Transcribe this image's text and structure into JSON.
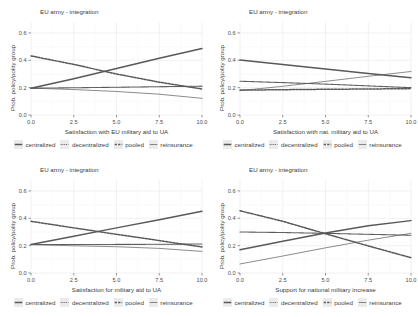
{
  "figure": {
    "facet_title": "EU army - integration",
    "ylabel": "Prob. policy/polity group",
    "panel_bg": "#ffffff",
    "grid_color": "#ebebeb",
    "line_color": "#595959",
    "text_color": "#3d3d3d"
  },
  "legend": {
    "items": [
      {
        "label": "centralized",
        "style": "solid-thick"
      },
      {
        "label": "decentralized",
        "style": "dotted-thin"
      },
      {
        "label": "pooled",
        "style": "dashed-thick"
      },
      {
        "label": "reinsurance",
        "style": "solid-thin"
      }
    ]
  },
  "chart_data": [
    {
      "type": "line",
      "title": "EU army - integration",
      "xlabel": "Satisfaction with EU military aid to UA",
      "ylabel": "Prob. policy/polity group",
      "xlim": [
        0,
        10
      ],
      "ylim": [
        0,
        0.68
      ],
      "xticks": [
        "0.0",
        "2.5",
        "5.0",
        "7.5",
        "10.0"
      ],
      "xtickvals": [
        0,
        2.5,
        5,
        7.5,
        10
      ],
      "yticks": [
        "0.0",
        "0.2",
        "0.4",
        "0.6"
      ],
      "ytickvals": [
        0,
        0.2,
        0.4,
        0.6
      ],
      "grid": true,
      "legend_position": "bottom",
      "x": [
        0,
        2.5,
        5,
        7.5,
        10
      ],
      "series": [
        {
          "name": "centralized",
          "style": "solid-thick",
          "values": [
            0.195,
            0.265,
            0.34,
            0.415,
            0.487
          ]
        },
        {
          "name": "decentralized",
          "style": "dotted-thin",
          "values": [
            0.196,
            0.199,
            0.203,
            0.207,
            0.211
          ]
        },
        {
          "name": "pooled",
          "style": "dashed-thick",
          "values": [
            0.432,
            0.37,
            0.3,
            0.24,
            0.19
          ]
        },
        {
          "name": "reinsurance",
          "style": "solid-thin",
          "values": [
            0.197,
            0.186,
            0.172,
            0.152,
            0.122
          ]
        }
      ]
    },
    {
      "type": "line",
      "title": "EU army - integration",
      "xlabel": "Satisfaction with nat. military aid to UA",
      "ylabel": "Prob. policy/polity group",
      "xlim": [
        0,
        10
      ],
      "ylim": [
        0,
        0.68
      ],
      "xticks": [
        "0.0",
        "2.5",
        "5.0",
        "7.5",
        "10.0"
      ],
      "xtickvals": [
        0,
        2.5,
        5,
        7.5,
        10
      ],
      "yticks": [
        "0.0",
        "0.2",
        "0.4",
        "0.6"
      ],
      "ytickvals": [
        0,
        0.2,
        0.4,
        0.6
      ],
      "grid": true,
      "legend_position": "bottom",
      "x": [
        0,
        2.5,
        5,
        7.5,
        10
      ],
      "series": [
        {
          "name": "centralized",
          "style": "solid-thick",
          "values": [
            0.402,
            0.37,
            0.336,
            0.303,
            0.272
          ]
        },
        {
          "name": "decentralized",
          "style": "dotted-thin",
          "values": [
            0.247,
            0.237,
            0.226,
            0.213,
            0.2
          ]
        },
        {
          "name": "pooled",
          "style": "dashed-thick",
          "values": [
            0.182,
            0.185,
            0.188,
            0.19,
            0.193
          ]
        },
        {
          "name": "reinsurance",
          "style": "solid-thin",
          "values": [
            0.178,
            0.21,
            0.246,
            0.283,
            0.318
          ]
        }
      ]
    },
    {
      "type": "line",
      "title": "EU army - integration",
      "xlabel": "Satisfaction for military aid to UA",
      "ylabel": "Prob. policy/polity group",
      "xlim": [
        0,
        10
      ],
      "ylim": [
        0,
        0.68
      ],
      "xticks": [
        "0.0",
        "2.5",
        "5.0",
        "7.5",
        "10.0"
      ],
      "xtickvals": [
        0,
        2.5,
        5,
        7.5,
        10
      ],
      "yticks": [
        "0.0",
        "0.2",
        "0.4",
        "0.6"
      ],
      "ytickvals": [
        0,
        0.2,
        0.4,
        0.6
      ],
      "grid": true,
      "legend_position": "bottom",
      "x": [
        0,
        2.5,
        5,
        7.5,
        10
      ],
      "series": [
        {
          "name": "centralized",
          "style": "solid-thick",
          "values": [
            0.209,
            0.268,
            0.33,
            0.39,
            0.452
          ]
        },
        {
          "name": "decentralized",
          "style": "dotted-thin",
          "values": [
            0.208,
            0.208,
            0.209,
            0.21,
            0.212
          ]
        },
        {
          "name": "pooled",
          "style": "dashed-thick",
          "values": [
            0.378,
            0.33,
            0.283,
            0.237,
            0.19
          ]
        },
        {
          "name": "reinsurance",
          "style": "solid-thin",
          "values": [
            0.207,
            0.199,
            0.192,
            0.18,
            0.158
          ]
        }
      ]
    },
    {
      "type": "line",
      "title": "EU army - integration",
      "xlabel": "Support for national military increase",
      "ylabel": "Prob. policy/polity group",
      "xlim": [
        0,
        10
      ],
      "ylim": [
        0,
        0.68
      ],
      "xticks": [
        "0.0",
        "2.5",
        "5.0",
        "7.5",
        "10.0"
      ],
      "xtickvals": [
        0,
        2.5,
        5,
        7.5,
        10
      ],
      "yticks": [
        "0.0",
        "0.2",
        "0.4",
        "0.6"
      ],
      "ytickvals": [
        0,
        0.2,
        0.4,
        0.6
      ],
      "grid": true,
      "legend_position": "bottom",
      "x": [
        0,
        2.5,
        5,
        7.5,
        10
      ],
      "series": [
        {
          "name": "centralized",
          "style": "solid-thick",
          "values": [
            0.17,
            0.232,
            0.292,
            0.345,
            0.383
          ]
        },
        {
          "name": "decentralized",
          "style": "dotted-thin",
          "values": [
            0.3,
            0.296,
            0.29,
            0.283,
            0.276
          ]
        },
        {
          "name": "pooled",
          "style": "dashed-thick",
          "values": [
            0.455,
            0.378,
            0.287,
            0.198,
            0.112
          ]
        },
        {
          "name": "reinsurance",
          "style": "solid-thin",
          "values": [
            0.066,
            0.124,
            0.184,
            0.24,
            0.29
          ]
        }
      ]
    }
  ]
}
